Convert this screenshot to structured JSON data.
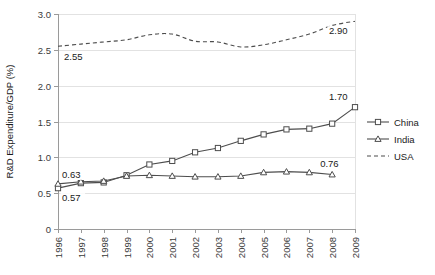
{
  "chart_data": {
    "type": "line",
    "title": "",
    "xlabel": "",
    "ylabel": "R&D Expenditure/GDP (%)",
    "x": [
      1996,
      1997,
      1998,
      1999,
      2000,
      2001,
      2002,
      2003,
      2004,
      2005,
      2006,
      2007,
      2008,
      2009
    ],
    "categories": [
      "1996",
      "1997",
      "1998",
      "1999",
      "2000",
      "2001",
      "2002",
      "2003",
      "2004",
      "2005",
      "2006",
      "2007",
      "2008",
      "2009"
    ],
    "ylim": [
      0,
      3.0
    ],
    "yticks": [
      0,
      0.5,
      1.0,
      1.5,
      2.0,
      2.5,
      3.0
    ],
    "ytick_labels": [
      "0",
      "0.5",
      "1.0",
      "1.5",
      "2.0",
      "2.5",
      "3.0"
    ],
    "grid": true,
    "legend_position": "right",
    "series": [
      {
        "name": "China",
        "marker": "square",
        "dash": false,
        "values": [
          0.57,
          0.64,
          0.65,
          0.75,
          0.9,
          0.95,
          1.07,
          1.13,
          1.23,
          1.32,
          1.39,
          1.4,
          1.47,
          1.7
        ]
      },
      {
        "name": "India",
        "marker": "triangle",
        "dash": false,
        "values": [
          0.63,
          0.66,
          0.67,
          0.74,
          0.75,
          0.74,
          0.73,
          0.73,
          0.74,
          0.79,
          0.8,
          0.79,
          0.76,
          null
        ]
      },
      {
        "name": "USA",
        "marker": "none",
        "dash": true,
        "values": [
          2.55,
          2.58,
          2.61,
          2.64,
          2.71,
          2.72,
          2.62,
          2.61,
          2.54,
          2.57,
          2.64,
          2.72,
          2.84,
          2.9
        ]
      }
    ],
    "annotations": [
      {
        "text": "2.55",
        "series": "USA",
        "x": 1996,
        "value": 2.55,
        "dx": 6,
        "dy": 14
      },
      {
        "text": "2.90",
        "series": "USA",
        "x": 2009,
        "value": 2.9,
        "dx": -26,
        "dy": 13
      },
      {
        "text": "1.70",
        "series": "China",
        "x": 2009,
        "value": 1.7,
        "dx": -26,
        "dy": -7
      },
      {
        "text": "0.63",
        "series": "India",
        "x": 1996,
        "value": 0.63,
        "dx": 4,
        "dy": -6
      },
      {
        "text": "0.57",
        "series": "China",
        "x": 1996,
        "value": 0.57,
        "dx": 4,
        "dy": 13
      },
      {
        "text": "0.76",
        "series": "India",
        "x": 2008,
        "value": 0.76,
        "dx": -12,
        "dy": -8
      }
    ],
    "colors": {
      "line": "#4d4d4d",
      "grid": "#e2e2e2",
      "axis": "#9a9a9a",
      "text": "#1a1a1a",
      "marker_fill": "#ffffff",
      "background": "#ffffff"
    }
  },
  "legend": {
    "items": [
      {
        "label": "China"
      },
      {
        "label": "India"
      },
      {
        "label": "USA"
      }
    ]
  }
}
